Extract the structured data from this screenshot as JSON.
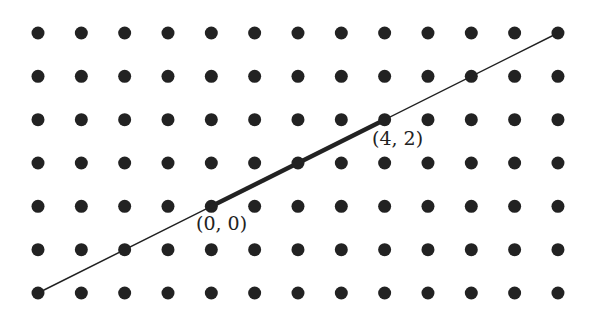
{
  "diagram": {
    "type": "lattice-line",
    "grid": {
      "columns": 13,
      "rows": 7,
      "origin_px": [
        38,
        293
      ],
      "spacing_px": [
        43.33,
        43.33
      ],
      "dot_radius": 6.5,
      "dot_color": "#222222"
    },
    "line": {
      "from_lattice": [
        -4,
        -2
      ],
      "to_lattice": [
        8,
        4
      ],
      "color": "#222222",
      "width": 1.5
    },
    "segment": {
      "from_lattice": [
        0,
        0
      ],
      "to_lattice": [
        4,
        2
      ],
      "color": "#222222",
      "width": 4.5
    },
    "labels": [
      {
        "text": "(0, 0)",
        "lattice": [
          0,
          0
        ]
      },
      {
        "text": "(4, 2)",
        "lattice": [
          4,
          2
        ]
      }
    ]
  }
}
